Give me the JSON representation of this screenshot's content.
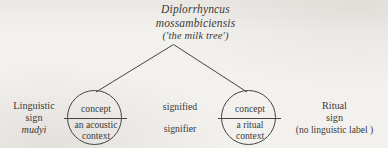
{
  "figure": {
    "type": "tree-diagram",
    "background_color": "#f3f1ee",
    "ink_color": "#3a3a38",
    "apex": {
      "species_line_1": "Diplorrhyncus",
      "species_line_2": "mossambiciensis",
      "common_name": "('the milk tree')"
    },
    "branches": [
      {
        "name": "branch-to-linguistic-sign",
        "from": "apex",
        "to": "circle-linguistic"
      },
      {
        "name": "branch-to-ritual-sign",
        "from": "apex",
        "to": "circle-ritual"
      }
    ],
    "left": {
      "label_line_1": "Linguistic",
      "label_line_2": "sign",
      "vernacular_term": "mudyi",
      "circle": {
        "top": "concept",
        "bottom_line_1": "an acoustic",
        "bottom_line_2": "context"
      }
    },
    "middle": {
      "upper_term": "signified",
      "lower_term": "signifier"
    },
    "right": {
      "label_line_1": "Ritual",
      "label_line_2": "sign",
      "label_line_3": "(no linguistic label )",
      "circle": {
        "top": "concept",
        "bottom_line_1": "a ritual",
        "bottom_line_2": "context"
      }
    }
  }
}
